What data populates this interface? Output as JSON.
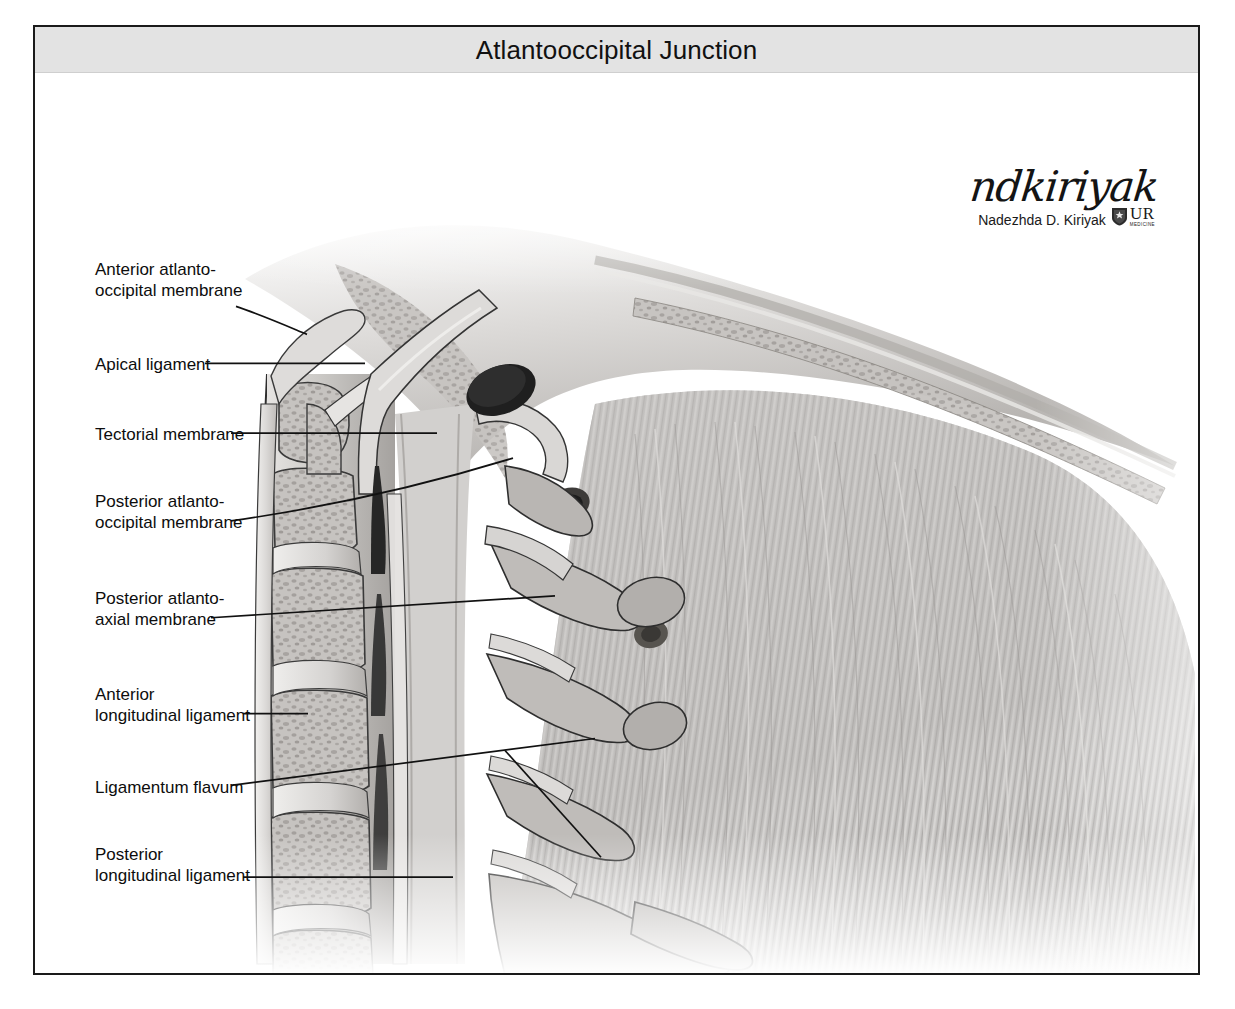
{
  "figure": {
    "title": "Atlantooccipital Junction",
    "view": "midsagittal",
    "style": "grayscale medical illustration"
  },
  "labels": [
    {
      "id": "anterior-atlantooccipital-membrane",
      "text": "Anterior atlanto-\noccipital membrane",
      "x": 60,
      "y": 232,
      "lines": 2
    },
    {
      "id": "apical-ligament",
      "text": "Apical ligament",
      "x": 60,
      "y": 330,
      "lines": 1
    },
    {
      "id": "tectorial-membrane",
      "text": "Tectorial membrane",
      "x": 60,
      "y": 400,
      "lines": 1
    },
    {
      "id": "posterior-atlantooccipital-membrane",
      "text": "Posterior atlanto-\noccipital membrane",
      "x": 60,
      "y": 465,
      "lines": 2
    },
    {
      "id": "posterior-atlantoaxial-membrane",
      "text": "Posterior atlanto-\naxial membrane",
      "x": 60,
      "y": 563,
      "lines": 2
    },
    {
      "id": "anterior-longitudinal-ligament",
      "text": "Anterior\nlongitudinal ligament",
      "x": 60,
      "y": 658,
      "lines": 2
    },
    {
      "id": "ligamentum-flavum",
      "text": "Ligamentum flavum",
      "x": 60,
      "y": 753,
      "lines": 1
    },
    {
      "id": "posterior-longitudinal-ligament",
      "text": "Posterior\nlongitudinal ligament",
      "x": 60,
      "y": 818,
      "lines": 2
    }
  ],
  "credit": {
    "signature_script": "ndkiriyak",
    "artist_name": "Nadezhda D. Kiriyak",
    "logo_initials": "UR",
    "logo_subtitle": "MEDICINE"
  },
  "colors": {
    "frame_border": "#1a1a1a",
    "title_bar_background": "#e3e3e3",
    "title_text": "#111111",
    "label_text": "#0d0d0d",
    "leader_line": "#111111",
    "page_background": "#ffffff",
    "bone_light": "#d8d6d4",
    "bone_mid": "#b5b2af",
    "bone_dark": "#8e8b88",
    "muscle_light": "#c9c7c5",
    "muscle_mid": "#a6a3a1",
    "foramen_dark": "#2a2a2a",
    "outline": "#2e2e2e"
  }
}
